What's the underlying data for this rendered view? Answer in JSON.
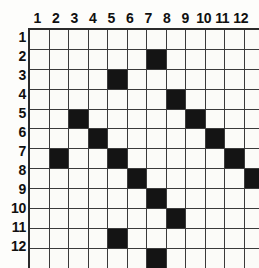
{
  "figure": {
    "name": "12x12-grid-puzzle",
    "grid_line_color": "#3a3a3a",
    "border_color": "#2b2b2b",
    "filled_color": "#141414",
    "empty_color": "#fbfbf8",
    "background_color": "#ffffff"
  },
  "axes": {
    "column_headers": [
      "1",
      "2",
      "3",
      "4",
      "5",
      "6",
      "7",
      "8",
      "9",
      "10",
      "11",
      "12"
    ],
    "row_headers": [
      "1",
      "2",
      "3",
      "4",
      "5",
      "6",
      "7",
      "8",
      "9",
      "10",
      "11",
      "12"
    ]
  },
  "chart_data": {
    "type": "heatmap",
    "title": "",
    "xlabel": "",
    "ylabel": "",
    "rows": 12,
    "columns": 12,
    "categories": [
      "1",
      "2",
      "3",
      "4",
      "5",
      "6",
      "7",
      "8",
      "9",
      "10",
      "11",
      "12"
    ],
    "row_categories": [
      "1",
      "2",
      "3",
      "4",
      "5",
      "6",
      "7",
      "8",
      "9",
      "10",
      "11",
      "12"
    ],
    "legend": [],
    "grid": true,
    "values": [
      [
        0,
        0,
        0,
        0,
        0,
        0,
        0,
        0,
        0,
        0,
        0,
        0
      ],
      [
        0,
        0,
        0,
        0,
        0,
        0,
        1,
        0,
        0,
        0,
        0,
        0
      ],
      [
        0,
        0,
        0,
        0,
        1,
        0,
        0,
        0,
        0,
        0,
        0,
        0
      ],
      [
        0,
        0,
        0,
        0,
        0,
        0,
        0,
        1,
        0,
        0,
        0,
        0
      ],
      [
        0,
        0,
        1,
        0,
        0,
        0,
        0,
        0,
        1,
        0,
        0,
        0
      ],
      [
        0,
        0,
        0,
        1,
        0,
        0,
        0,
        0,
        0,
        1,
        0,
        0
      ],
      [
        0,
        1,
        0,
        0,
        1,
        0,
        0,
        0,
        0,
        0,
        1,
        0
      ],
      [
        0,
        0,
        0,
        0,
        0,
        1,
        0,
        0,
        0,
        0,
        0,
        1
      ],
      [
        0,
        0,
        0,
        0,
        0,
        0,
        1,
        0,
        0,
        0,
        0,
        0
      ],
      [
        0,
        0,
        0,
        0,
        0,
        0,
        0,
        1,
        0,
        0,
        0,
        0
      ],
      [
        0,
        0,
        0,
        0,
        1,
        0,
        0,
        0,
        0,
        0,
        0,
        0
      ],
      [
        0,
        0,
        0,
        0,
        0,
        0,
        1,
        0,
        0,
        0,
        0,
        0
      ]
    ],
    "filled_cells": [
      {
        "row": 2,
        "col": 7
      },
      {
        "row": 3,
        "col": 5
      },
      {
        "row": 4,
        "col": 8
      },
      {
        "row": 5,
        "col": 3
      },
      {
        "row": 5,
        "col": 9
      },
      {
        "row": 6,
        "col": 4
      },
      {
        "row": 6,
        "col": 10
      },
      {
        "row": 7,
        "col": 2
      },
      {
        "row": 7,
        "col": 5
      },
      {
        "row": 7,
        "col": 11
      },
      {
        "row": 8,
        "col": 6
      },
      {
        "row": 8,
        "col": 12
      },
      {
        "row": 9,
        "col": 7
      },
      {
        "row": 10,
        "col": 8
      },
      {
        "row": 11,
        "col": 5
      },
      {
        "row": 12,
        "col": 7
      }
    ]
  }
}
